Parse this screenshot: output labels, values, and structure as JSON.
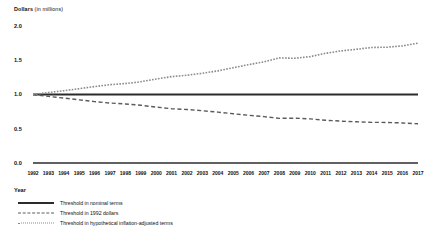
{
  "chart_data": {
    "type": "line",
    "title": "",
    "ylabel": "Dollars (in millions)",
    "ylabel_bold_prefix": "Dollars",
    "ylabel_rest": " (in millions)",
    "xlabel": "Year",
    "ylim": [
      0.0,
      2.0
    ],
    "yticks": [
      "0.0",
      "0.5",
      "1.0",
      "1.5",
      "2.0"
    ],
    "ytick_values": [
      0.0,
      0.5,
      1.0,
      1.5,
      2.0
    ],
    "grid": false,
    "legend_position": "below-axis-left",
    "categories": [
      "1992",
      "1993",
      "1994",
      "1995",
      "1996",
      "1997",
      "1998",
      "1999",
      "2000",
      "2001",
      "2002",
      "2003",
      "2004",
      "2005",
      "2006",
      "2007",
      "2008",
      "2009",
      "2010",
      "2011",
      "2012",
      "2013",
      "2014",
      "2015",
      "2016",
      "2017"
    ],
    "x": [
      1992,
      1993,
      1994,
      1995,
      1996,
      1997,
      1998,
      1999,
      2000,
      2001,
      2002,
      2003,
      2004,
      2005,
      2006,
      2007,
      2008,
      2009,
      2010,
      2011,
      2012,
      2013,
      2014,
      2015,
      2016,
      2017
    ],
    "series": [
      {
        "name": "Threshold in nominal terms",
        "style": "solid",
        "color": "#2b2b2b",
        "values": [
          1.0,
          1.0,
          1.0,
          1.0,
          1.0,
          1.0,
          1.0,
          1.0,
          1.0,
          1.0,
          1.0,
          1.0,
          1.0,
          1.0,
          1.0,
          1.0,
          1.0,
          1.0,
          1.0,
          1.0,
          1.0,
          1.0,
          1.0,
          1.0,
          1.0,
          1.0
        ]
      },
      {
        "name": "Threshold in 1992 dollars",
        "style": "dashed",
        "color": "#5a5a5a",
        "values": [
          1.0,
          0.972,
          0.948,
          0.922,
          0.896,
          0.875,
          0.862,
          0.843,
          0.816,
          0.793,
          0.781,
          0.763,
          0.743,
          0.719,
          0.696,
          0.677,
          0.652,
          0.654,
          0.644,
          0.624,
          0.611,
          0.602,
          0.593,
          0.592,
          0.585,
          0.572
        ]
      },
      {
        "name": "Threshold in hypothetical inflation-adjusted terms",
        "style": "dotted",
        "color": "#8a8a8a",
        "values": [
          1.0,
          1.029,
          1.055,
          1.085,
          1.116,
          1.143,
          1.16,
          1.186,
          1.226,
          1.261,
          1.281,
          1.31,
          1.345,
          1.391,
          1.436,
          1.477,
          1.534,
          1.529,
          1.553,
          1.602,
          1.636,
          1.66,
          1.687,
          1.69,
          1.71,
          1.749
        ]
      }
    ]
  },
  "legend": {
    "items": [
      {
        "label": "Threshold in nominal terms",
        "style": "solid"
      },
      {
        "label": "Threshold in 1992 dollars",
        "style": "dashed"
      },
      {
        "label": "Threshold in hypothetical inflation-adjusted terms",
        "style": "dotted"
      }
    ]
  }
}
